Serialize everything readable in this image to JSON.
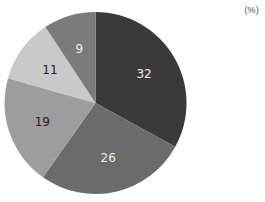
{
  "chart_data": {
    "type": "pie",
    "title": "",
    "unit_label": "(%)",
    "start_angle_deg": 0,
    "direction": "clockwise",
    "categories": [
      "A",
      "B",
      "C",
      "D",
      "E"
    ],
    "values": [
      32,
      26,
      19,
      11,
      9
    ],
    "labels": [
      "32",
      "26",
      "19",
      "11",
      "9"
    ],
    "colors": [
      "#3a3a3a",
      "#6b6b6b",
      "#9d9d9d",
      "#c9c9c9",
      "#7b7b7b"
    ],
    "label_colors": [
      "#f0f0f0",
      "#f0f0f0",
      "#222222",
      "#222222",
      "#f0f0f0"
    ],
    "legend": "none",
    "center": [
      95.5,
      103
    ],
    "radius": 91
  }
}
